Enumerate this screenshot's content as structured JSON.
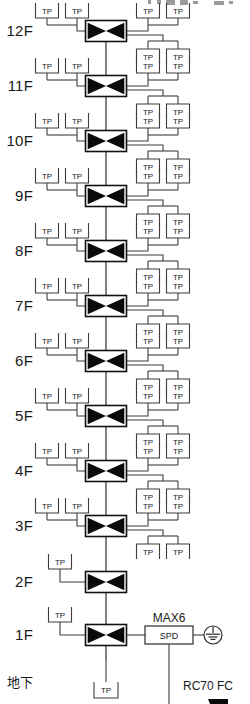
{
  "diagram": {
    "terminal_label": "TP",
    "colors": {
      "line": "#3d3d3d",
      "valve_fill": "#0a0a0a",
      "text": "#1a1a1a",
      "background": "#ffffff"
    },
    "floors": [
      {
        "label": "12F",
        "y": 31,
        "left_taps": 2,
        "right_upper_taps": 2,
        "right_lower_taps": 2
      },
      {
        "label": "11F",
        "y": 86,
        "left_taps": 2,
        "right_upper_taps": 2,
        "right_lower_taps": 2
      },
      {
        "label": "10F",
        "y": 141,
        "left_taps": 2,
        "right_upper_taps": 2,
        "right_lower_taps": 2
      },
      {
        "label": "9F",
        "y": 196,
        "left_taps": 2,
        "right_upper_taps": 2,
        "right_lower_taps": 2
      },
      {
        "label": "8F",
        "y": 251,
        "left_taps": 2,
        "right_upper_taps": 2,
        "right_lower_taps": 2
      },
      {
        "label": "7F",
        "y": 306,
        "left_taps": 2,
        "right_upper_taps": 2,
        "right_lower_taps": 2
      },
      {
        "label": "6F",
        "y": 361,
        "left_taps": 2,
        "right_upper_taps": 2,
        "right_lower_taps": 2
      },
      {
        "label": "5F",
        "y": 416,
        "left_taps": 2,
        "right_upper_taps": 2,
        "right_lower_taps": 2
      },
      {
        "label": "4F",
        "y": 471,
        "left_taps": 2,
        "right_upper_taps": 2,
        "right_lower_taps": 2
      },
      {
        "label": "3F",
        "y": 526,
        "left_taps": 2,
        "right_upper_taps": 2,
        "right_lower_taps": 2
      },
      {
        "label": "2F",
        "y": 582,
        "left_taps": 1,
        "right_upper_taps": 0,
        "right_lower_taps": 0
      },
      {
        "label": "1F",
        "y": 635,
        "left_taps": 1,
        "right_upper_taps": 0,
        "right_lower_taps": 0
      }
    ],
    "basement": {
      "label": "地下",
      "label_y": 682,
      "terminal_label": "TP",
      "terminal_x": 106,
      "terminal_y": 690
    },
    "surge_protector": {
      "annotation": "MAX6",
      "box_label": "SPD",
      "ground_symbol": "earth-ground"
    },
    "cable_note": {
      "label": "RC70 FC"
    }
  }
}
